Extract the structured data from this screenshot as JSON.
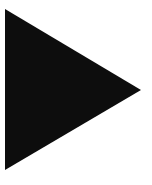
{
  "canvas": {
    "width": 152,
    "height": 185,
    "background_color": "#ffffff"
  },
  "figure": {
    "name": "play-triangle",
    "label": "Right-pointing solid triangle",
    "shape_type": "triangle",
    "direction": "right",
    "fill_color": "#0d0d0d",
    "stroke_color": "none",
    "vertices": [
      {
        "name": "top-left-vertex",
        "x": 5,
        "y": 9
      },
      {
        "name": "right-apex-vertex",
        "x": 141,
        "y": 90
      },
      {
        "name": "bottom-left-vertex",
        "x": 5,
        "y": 170
      }
    ],
    "points_attribute": "5,9 141,90 5,170",
    "bounding_box": {
      "x": 5,
      "y": 9,
      "width": 136,
      "height": 161
    }
  }
}
